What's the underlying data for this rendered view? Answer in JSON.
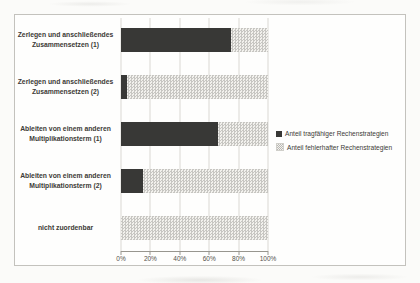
{
  "figure": {
    "background_color": "#fbfbf9",
    "frame_border_color": "#c3c2bd"
  },
  "chart_data": {
    "type": "bar",
    "orientation": "horizontal",
    "stacked": true,
    "unit": "percent",
    "categories": [
      [
        "Zerlegen und anschließendes",
        "Zusammensetzen (1)"
      ],
      [
        "Zerlegen und anschließendes",
        "Zusammensetzen (2)"
      ],
      [
        "Ableiten von einem anderen",
        "Multiplikationsterm (1)"
      ],
      [
        "Ableiten von einem anderen",
        "Multiplikationsterm (2)"
      ],
      [
        "nicht zuordenbar"
      ]
    ],
    "series": [
      {
        "name": "Anteil tragfähiger Rechenstrategien",
        "values": [
          75,
          4,
          66,
          15,
          0
        ],
        "style": "solid",
        "color": "#383836"
      },
      {
        "name": "Anteil fehlerhafter Rechenstrategien",
        "values": [
          25,
          96,
          34,
          85,
          100
        ],
        "style": "dotted-pattern",
        "color": "#c7c6c2",
        "pattern_background": "#f2f1ed"
      }
    ],
    "x_ticks": [
      "0%",
      "20%",
      "40%",
      "60%",
      "80%",
      "100%"
    ],
    "xlim": [
      0,
      100
    ],
    "grid": "vertical",
    "gridline_color": "#d9d8d4",
    "axis_line_color": "#98968f",
    "legend_position": "right",
    "text_color": "#3c3a36"
  }
}
